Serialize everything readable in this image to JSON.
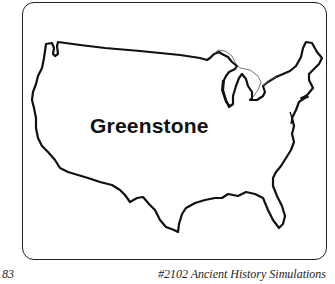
{
  "map": {
    "region": "United States (contiguous)",
    "label": "Greenstone"
  },
  "footer": {
    "page_number": "83",
    "title": "#2102 Ancient History Simulations"
  }
}
